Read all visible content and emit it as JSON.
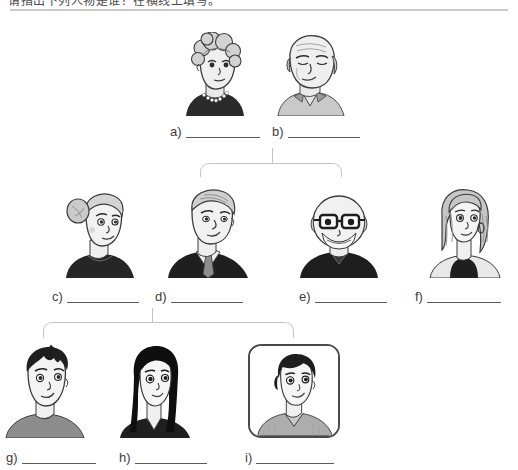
{
  "header": {
    "instruction": "请指出下列人物是谁？在横线上填写。",
    "visible_note": "clipped-top-line"
  },
  "worksheet": {
    "title": "Family tree fill-in-the-blank",
    "blank_placeholder": "",
    "labels": [
      {
        "id": "a",
        "tag": "a)",
        "answer": "",
        "x": 170,
        "y": 124,
        "blank_width": 74
      },
      {
        "id": "b",
        "tag": "b)",
        "answer": "",
        "x": 272,
        "y": 124,
        "blank_width": 72
      },
      {
        "id": "c",
        "tag": "c)",
        "answer": "",
        "x": 52,
        "y": 289,
        "blank_width": 72
      },
      {
        "id": "d",
        "tag": "d)",
        "answer": "",
        "x": 155,
        "y": 289,
        "blank_width": 72
      },
      {
        "id": "e",
        "tag": "e)",
        "answer": "",
        "x": 299,
        "y": 289,
        "blank_width": 72
      },
      {
        "id": "f",
        "tag": "f)",
        "answer": "",
        "x": 415,
        "y": 289,
        "blank_width": 74
      },
      {
        "id": "g",
        "tag": "g)",
        "answer": "",
        "x": 6,
        "y": 450,
        "blank_width": 74
      },
      {
        "id": "h",
        "tag": "h)",
        "answer": "",
        "x": 119,
        "y": 450,
        "blank_width": 72
      },
      {
        "id": "i",
        "tag": "i)",
        "answer": "",
        "x": 245,
        "y": 450,
        "blank_width": 78
      }
    ],
    "portraits": [
      {
        "id": "a",
        "person": "grandmother",
        "description": "elderly woman, curly gray hair, pearl necklace, dark top",
        "x": 180,
        "y": 32,
        "w": 70,
        "h": 84
      },
      {
        "id": "b",
        "person": "grandfather",
        "description": "elderly balding man, gray hair at sides, light collared shirt",
        "x": 268,
        "y": 30,
        "w": 80,
        "h": 86
      },
      {
        "id": "c",
        "person": "aunt",
        "description": "woman with gray hair in a bun, dark top",
        "x": 58,
        "y": 188,
        "w": 80,
        "h": 90
      },
      {
        "id": "d",
        "person": "father",
        "description": "man with gray hair, dark suit, tie",
        "x": 164,
        "y": 186,
        "w": 88,
        "h": 92
      },
      {
        "id": "e",
        "person": "uncle",
        "description": "balding man with glasses and beard, dark sweater",
        "x": 296,
        "y": 186,
        "w": 86,
        "h": 92
      },
      {
        "id": "f",
        "person": "mother",
        "description": "woman with shoulder-length hair, hoop earrings, black tank top",
        "x": 424,
        "y": 186,
        "w": 80,
        "h": 92
      },
      {
        "id": "g",
        "person": "brother",
        "description": "young man with dark hair, gray t-shirt",
        "x": 2,
        "y": 340,
        "w": 88,
        "h": 98
      },
      {
        "id": "h",
        "person": "sister",
        "description": "young woman with long black hair, dark top",
        "x": 110,
        "y": 340,
        "w": 88,
        "h": 98
      },
      {
        "id": "i",
        "person": "child-selected",
        "description": "child with short dark hair, gray v-neck shirt, shown inside a rounded highlight frame",
        "x": 248,
        "y": 344,
        "w": 92,
        "h": 94,
        "framed": true
      }
    ],
    "connectors": [
      {
        "id": "gen1-stem",
        "type": "vline",
        "x": 272,
        "y": 148,
        "w": 1.4,
        "h": 16
      },
      {
        "id": "gen1-bracket",
        "type": "bracket",
        "x": 200,
        "y": 163,
        "w": 142,
        "h": 14
      },
      {
        "id": "gen2-stem",
        "type": "vline",
        "x": 152,
        "y": 308,
        "w": 1.4,
        "h": 15
      },
      {
        "id": "gen2-bracket",
        "type": "bracket",
        "x": 43,
        "y": 322,
        "w": 251,
        "h": 16
      }
    ]
  },
  "colors": {
    "ink": "#3d3d3d",
    "rule": "#5a5a5a",
    "connector": "#c4c4c4",
    "frame": "#4a4a4a",
    "background": "#ffffff"
  }
}
